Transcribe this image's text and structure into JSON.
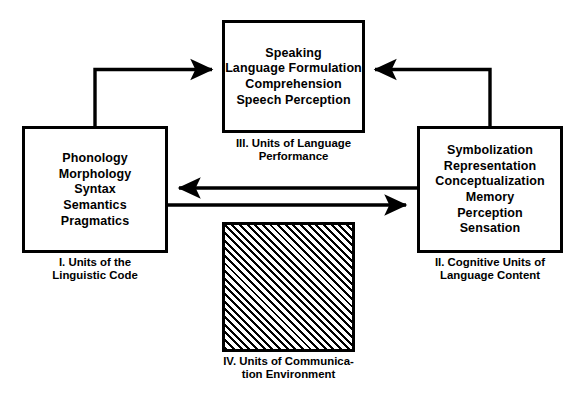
{
  "figure": {
    "background_color": "#ffffff",
    "line_color": "#000000"
  },
  "boxes": [
    {
      "id": "box-1",
      "numeral": "I.",
      "lines": [
        "Phonology",
        "Morphology",
        "Syntax",
        "Semantics",
        "Pragmatics"
      ],
      "caption": "I. Units of the\nLinguistic Code",
      "fill": "white"
    },
    {
      "id": "box-2",
      "numeral": "II.",
      "lines": [
        "Symbolization",
        "Representation",
        "Conceptualization",
        "Memory",
        "Perception",
        "Sensation"
      ],
      "caption": "II. Cognitive Units of\nLanguage Content",
      "fill": "white"
    },
    {
      "id": "box-3",
      "numeral": "III.",
      "lines": [
        "Speaking",
        "Language Formulation",
        "Comprehension",
        "Speech Perception"
      ],
      "caption": "III. Units of Language\nPerformance",
      "fill": "white"
    },
    {
      "id": "box-4",
      "numeral": "IV.",
      "lines": [],
      "caption": "IV. Units of Communica-\ntion Environment",
      "fill": "diagonal-hatch"
    }
  ],
  "arrows": [
    {
      "name": "arrow-code-to-performance",
      "from": "box-1",
      "to": "box-3",
      "direction": "up-then-right",
      "head": "right"
    },
    {
      "name": "arrow-content-to-performance",
      "from": "box-2",
      "to": "box-3",
      "direction": "up-then-left",
      "head": "left"
    },
    {
      "name": "arrow-content-to-code",
      "from": "box-2",
      "to": "box-1",
      "direction": "horizontal",
      "head": "left"
    },
    {
      "name": "arrow-code-to-content",
      "from": "box-1",
      "to": "box-2",
      "direction": "horizontal",
      "head": "right"
    }
  ]
}
